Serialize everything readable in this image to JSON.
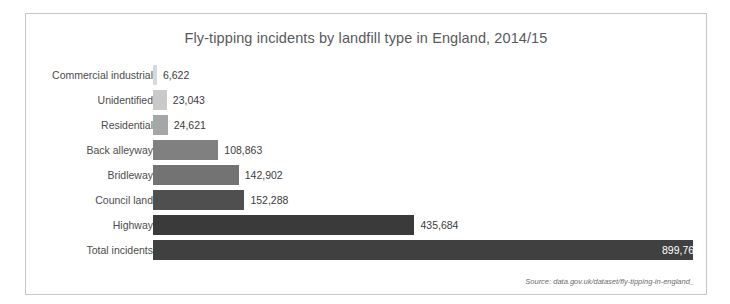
{
  "chart_data": {
    "type": "bar",
    "orientation": "horizontal",
    "title": "Fly-tipping incidents by landfill type in England, 2014/15",
    "xlabel": "",
    "ylabel": "",
    "grid": false,
    "legend": null,
    "xlim": [
      0,
      899763
    ],
    "categories": [
      "Commercial industrial",
      "Unidentified",
      "Residential",
      "Back alleyway",
      "Bridleway",
      "Council land",
      "Highway",
      "Total incidents"
    ],
    "values": [
      6622,
      23043,
      24621,
      108863,
      142902,
      152288,
      435684,
      899763
    ],
    "value_labels": [
      "6,622",
      "23,043",
      "24,621",
      "108,863",
      "142,902",
      "152,288",
      "435,684",
      "899,763"
    ],
    "bar_colors": [
      "#d9d9d9",
      "#c9c9c9",
      "#a6a6a6",
      "#808080",
      "#737373",
      "#4f4f4f",
      "#3a3a3a",
      "#404040"
    ],
    "label_placement": [
      "outside",
      "outside",
      "outside",
      "outside",
      "outside",
      "outside",
      "outside",
      "inside"
    ]
  },
  "source": {
    "text": "Source: data.gov.uk/dataset/fly-tipping-in-england_"
  },
  "colors": {
    "border": "#c8c8c8",
    "title_text": "#58595b",
    "category_text": "#4c4c4c",
    "value_text": "#3c3c3c",
    "value_text_inverse": "#ffffff",
    "background": "#ffffff"
  }
}
